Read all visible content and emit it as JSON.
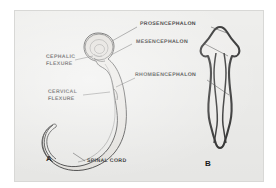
{
  "figure": {
    "title_visible": false,
    "background_color": "#ffffff",
    "plate_color": "#f2f2f0",
    "ink_color": "#3a3a3a"
  },
  "panels": [
    {
      "id": "A",
      "letter": "A",
      "description": "lateral view of embryonic neural tube with brain flexures"
    },
    {
      "id": "B",
      "letter": "B",
      "description": "dorsal view of embryonic brain vesicles"
    }
  ],
  "labels": {
    "prosencephalon": "PROSENCEPHALON",
    "mesencephalon": "MESENCEPHALON",
    "rhombencephalon": "RHOMBENCEPHALON",
    "cephalic_flexure_line1": "CEPHALIC",
    "cephalic_flexure_line2": "FLEXURE",
    "cervical_flexure_line1": "CERVICAL",
    "cervical_flexure_line2": "FLEXURE",
    "spinal_cord": "SPINAL CORD"
  }
}
